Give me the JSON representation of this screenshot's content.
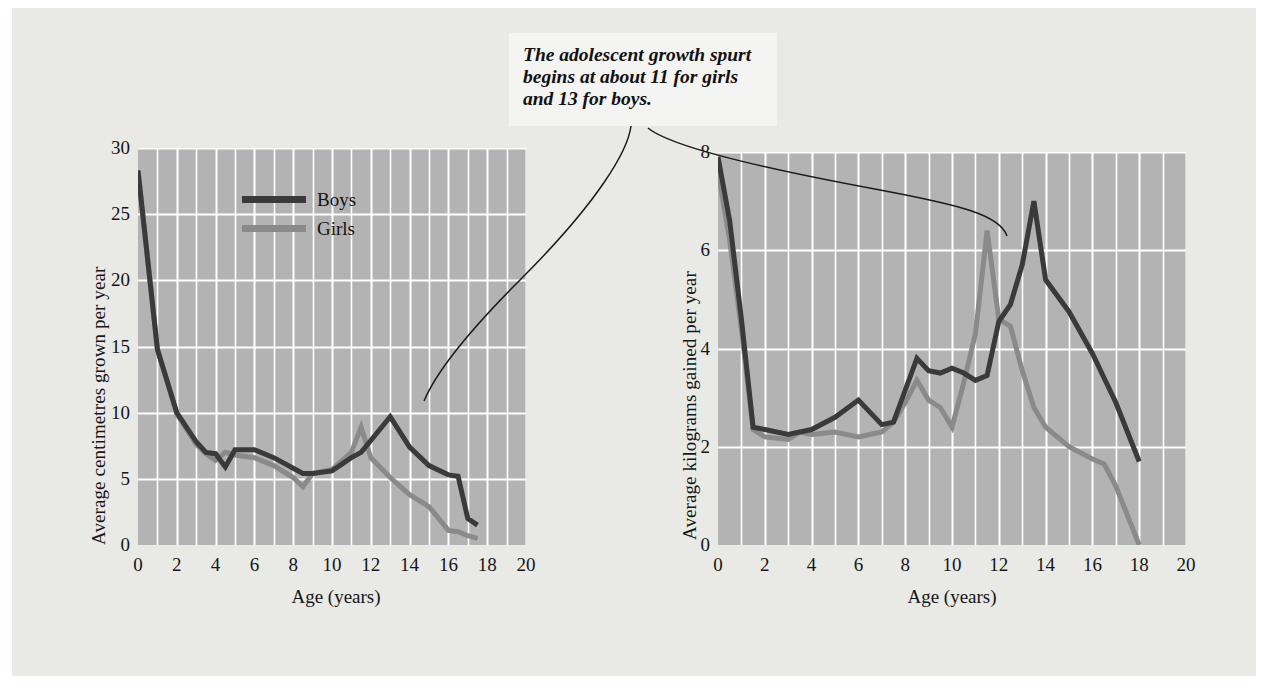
{
  "figure": {
    "background_color": "#e9e9e6",
    "plot_background_color": "#b3b3b3",
    "gridline_color": "#ffffff",
    "boys_color": "#3a3a3a",
    "girls_color": "#8a8a8a"
  },
  "callout": {
    "line1": "The adolescent growth spurt",
    "line2": "begins at about 11 for girls",
    "line3": "and 13 for boys.",
    "full_text": "The adolescent growth spurt begins at about 11 for girls and 13 for boys."
  },
  "legend": {
    "boys_label": "Boys",
    "girls_label": "Girls"
  },
  "chart_data": [
    {
      "type": "line",
      "id": "height-velocity",
      "title": "",
      "xlabel": "Age (years)",
      "ylabel": "Average centimetres grown per year",
      "xlim": [
        0,
        20
      ],
      "ylim": [
        0,
        30
      ],
      "xticks": [
        0,
        2,
        4,
        6,
        8,
        10,
        12,
        14,
        16,
        18,
        20
      ],
      "xticklabels": [
        "0",
        "2",
        "4",
        "6",
        "8",
        "10",
        "12",
        "14",
        "16",
        "18",
        "20"
      ],
      "yticks": [
        0,
        5,
        10,
        15,
        20,
        25,
        30
      ],
      "yticklabels": [
        "0",
        "5",
        "10",
        "15",
        "20",
        "25",
        "30"
      ],
      "grid": true,
      "legend_position": "upper-center",
      "x": [
        0,
        1,
        2,
        3,
        3.5,
        4,
        4.5,
        5,
        6,
        7,
        8,
        8.5,
        9,
        10,
        11,
        11.5,
        12,
        13,
        14,
        15,
        16,
        16.5,
        17,
        17.5
      ],
      "series": [
        {
          "name": "Boys",
          "color": "#3a3a3a",
          "values": [
            28.3,
            14.8,
            10.0,
            7.8,
            7.0,
            6.9,
            5.9,
            7.2,
            7.2,
            6.6,
            5.8,
            5.4,
            5.4,
            5.6,
            6.6,
            7.0,
            7.9,
            9.7,
            7.4,
            6.0,
            5.3,
            5.2,
            2.0,
            1.5
          ]
        },
        {
          "name": "Girls",
          "color": "#8a8a8a",
          "values": [
            28.3,
            14.8,
            9.9,
            7.6,
            6.9,
            6.4,
            7.0,
            6.8,
            6.6,
            6.0,
            5.1,
            4.4,
            5.4,
            5.7,
            7.0,
            8.9,
            6.6,
            5.1,
            3.8,
            2.9,
            1.1,
            1.0,
            0.7,
            0.5
          ]
        }
      ]
    },
    {
      "type": "line",
      "id": "weight-velocity",
      "title": "",
      "xlabel": "Age (years)",
      "ylabel": "Average kilograms gained per year",
      "xlim": [
        0,
        20
      ],
      "ylim": [
        0,
        8
      ],
      "xticks": [
        0,
        2,
        4,
        6,
        8,
        10,
        12,
        14,
        16,
        18,
        20
      ],
      "xticklabels": [
        "0",
        "2",
        "4",
        "6",
        "8",
        "10",
        "12",
        "14",
        "16",
        "18",
        "20"
      ],
      "yticks": [
        0,
        2,
        4,
        6,
        8
      ],
      "yticklabels": [
        "0",
        "2",
        "4",
        "6",
        "8"
      ],
      "grid": true,
      "legend_position": "none",
      "x": [
        0,
        0.5,
        1,
        1.5,
        2,
        3,
        3.5,
        4,
        5,
        6,
        6.5,
        7,
        7.5,
        8,
        8.5,
        9,
        9.5,
        10,
        10.5,
        11,
        11.5,
        12,
        12.5,
        13,
        13.5,
        14,
        15,
        16,
        16.5,
        17,
        18
      ],
      "series": [
        {
          "name": "Boys",
          "color": "#3a3a3a",
          "values": [
            7.9,
            6.6,
            4.6,
            2.4,
            2.35,
            2.25,
            2.3,
            2.35,
            2.6,
            2.95,
            2.7,
            2.45,
            2.5,
            3.15,
            3.8,
            3.55,
            3.5,
            3.6,
            3.5,
            3.35,
            3.45,
            4.55,
            4.9,
            5.7,
            7.0,
            5.4,
            4.75,
            3.9,
            3.4,
            2.9,
            1.7
          ]
        },
        {
          "name": "Girls",
          "color": "#8a8a8a",
          "values": [
            7.6,
            6.2,
            4.4,
            2.35,
            2.2,
            2.15,
            2.3,
            2.25,
            2.3,
            2.2,
            2.25,
            2.3,
            2.5,
            2.9,
            3.35,
            2.95,
            2.8,
            2.4,
            3.3,
            4.3,
            6.4,
            4.6,
            4.45,
            3.55,
            2.8,
            2.4,
            2.0,
            1.75,
            1.65,
            1.2,
            0.0
          ]
        }
      ]
    }
  ]
}
